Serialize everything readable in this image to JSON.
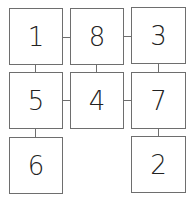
{
  "diagram": {
    "grid": [
      [
        "1",
        "8",
        "3"
      ],
      [
        "5",
        "4",
        "7"
      ],
      [
        "6",
        "",
        "2"
      ]
    ],
    "boxes": [
      {
        "id": "box-1",
        "label": "1",
        "row": 0,
        "col": 0
      },
      {
        "id": "box-8",
        "label": "8",
        "row": 0,
        "col": 1
      },
      {
        "id": "box-3",
        "label": "3",
        "row": 0,
        "col": 2
      },
      {
        "id": "box-5",
        "label": "5",
        "row": 1,
        "col": 0
      },
      {
        "id": "box-4",
        "label": "4",
        "row": 1,
        "col": 1
      },
      {
        "id": "box-7",
        "label": "7",
        "row": 1,
        "col": 2
      },
      {
        "id": "box-6",
        "label": "6",
        "row": 2,
        "col": 0
      },
      {
        "id": "box-2",
        "label": "2",
        "row": 2,
        "col": 2
      }
    ],
    "connections": [
      [
        "1",
        "8"
      ],
      [
        "8",
        "3"
      ],
      [
        "1",
        "5"
      ],
      [
        "8",
        "4"
      ],
      [
        "3",
        "7"
      ],
      [
        "5",
        "4"
      ],
      [
        "4",
        "7"
      ],
      [
        "5",
        "6"
      ],
      [
        "7",
        "2"
      ]
    ],
    "line_color": "#6e6e6e"
  }
}
